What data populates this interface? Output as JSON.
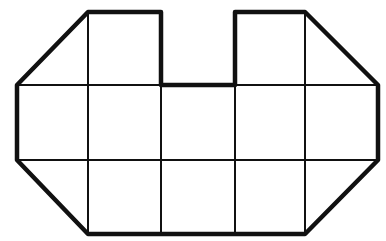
{
  "figure": {
    "colors": {
      "background": "#ffffff",
      "stroke": "#111111"
    },
    "grid": {
      "columns_x": [
        17,
        88,
        161,
        235,
        305,
        378
      ],
      "rows_y": [
        12,
        85,
        160,
        234
      ]
    },
    "outline_points": [
      [
        88,
        12
      ],
      [
        161,
        12
      ],
      [
        161,
        85
      ],
      [
        235,
        85
      ],
      [
        235,
        12
      ],
      [
        305,
        12
      ],
      [
        378,
        85
      ],
      [
        378,
        160
      ],
      [
        305,
        234
      ],
      [
        88,
        234
      ],
      [
        17,
        160
      ],
      [
        17,
        85
      ]
    ]
  }
}
